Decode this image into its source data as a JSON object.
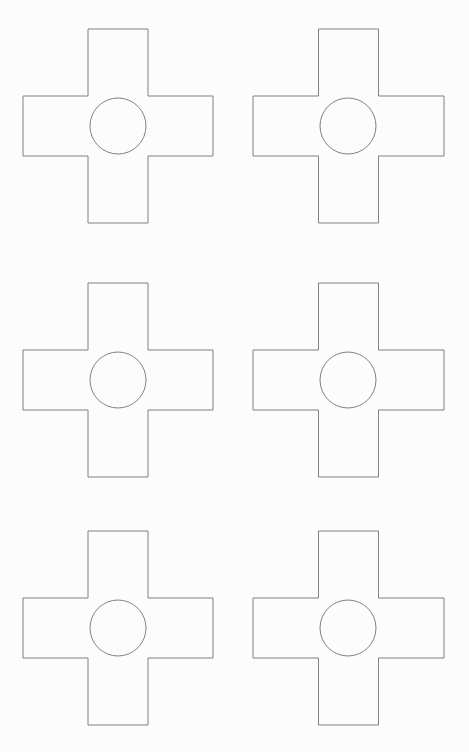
{
  "page": {
    "width": 469,
    "height": 752,
    "background_color": "#fcfcfc",
    "orientation": "portrait",
    "visible_text": []
  },
  "style": {
    "stroke_color": "#808080",
    "stroke_width": 1,
    "fill_color": "none",
    "line_style": "solid"
  },
  "layout": {
    "type": "grid",
    "columns": 2,
    "rows": 3,
    "total_shapes": 6,
    "column_left_x": 23,
    "column_right_x": 253,
    "row_tops": [
      29,
      283,
      531
    ]
  },
  "shape_template": {
    "name": "cross-with-center-circle",
    "outline_kind": "greek-cross",
    "bounding_width": 190,
    "bounding_height": 194,
    "arm_width": 60,
    "arm_height": 60,
    "circle_radius": 28,
    "circle_center_offset_x": 95,
    "circle_center_offset_y": 97
  },
  "shapes": [
    {
      "id": "cross-1",
      "label": "Cross 1",
      "row": 1,
      "column": 1,
      "x": 23,
      "y": 29,
      "width": 190,
      "height": 194,
      "circle_cx": 118,
      "circle_cy": 126,
      "circle_r": 28
    },
    {
      "id": "cross-2",
      "label": "Cross 2",
      "row": 1,
      "column": 2,
      "x": 253,
      "y": 29,
      "width": 191,
      "height": 194,
      "circle_cx": 348,
      "circle_cy": 126,
      "circle_r": 28
    },
    {
      "id": "cross-3",
      "label": "Cross 3",
      "row": 2,
      "column": 1,
      "x": 23,
      "y": 283,
      "width": 190,
      "height": 194,
      "circle_cx": 118,
      "circle_cy": 380,
      "circle_r": 28
    },
    {
      "id": "cross-4",
      "label": "Cross 4",
      "row": 2,
      "column": 2,
      "x": 253,
      "y": 283,
      "width": 191,
      "height": 194,
      "circle_cx": 348,
      "circle_cy": 380,
      "circle_r": 28
    },
    {
      "id": "cross-5",
      "label": "Cross 5",
      "row": 3,
      "column": 1,
      "x": 23,
      "y": 531,
      "width": 190,
      "height": 194,
      "circle_cx": 118,
      "circle_cy": 628,
      "circle_r": 28
    },
    {
      "id": "cross-6",
      "label": "Cross 6",
      "row": 3,
      "column": 2,
      "x": 253,
      "y": 531,
      "width": 191,
      "height": 194,
      "circle_cx": 348,
      "circle_cy": 628,
      "circle_r": 28
    }
  ]
}
